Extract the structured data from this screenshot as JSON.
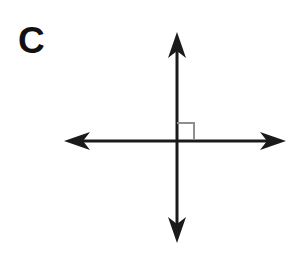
{
  "figure": {
    "label": "C",
    "background_color": "#ffffff",
    "stroke_color": "#1a1a1a",
    "marker_color": "#8f8f8f",
    "line_width": 3,
    "marker_line_width": 2,
    "intersection": {
      "x": 177,
      "y": 141
    },
    "horizontal_line": {
      "name": "horizontal-double-arrow",
      "x1": 64,
      "y1": 141,
      "x2": 286,
      "y2": 141,
      "arrowheads": [
        "left",
        "right"
      ]
    },
    "vertical_line": {
      "name": "vertical-double-arrow",
      "x1": 177,
      "y1": 32,
      "x2": 177,
      "y2": 243,
      "arrowheads": [
        "up",
        "down"
      ]
    },
    "right_angle_marker": {
      "name": "right-angle-square",
      "quadrant": "upper-right",
      "x": 178,
      "y": 123,
      "size": 16,
      "angle_degrees": 90
    },
    "arrowhead": {
      "length": 26,
      "half_width": 9,
      "notch_depth": 7
    }
  }
}
